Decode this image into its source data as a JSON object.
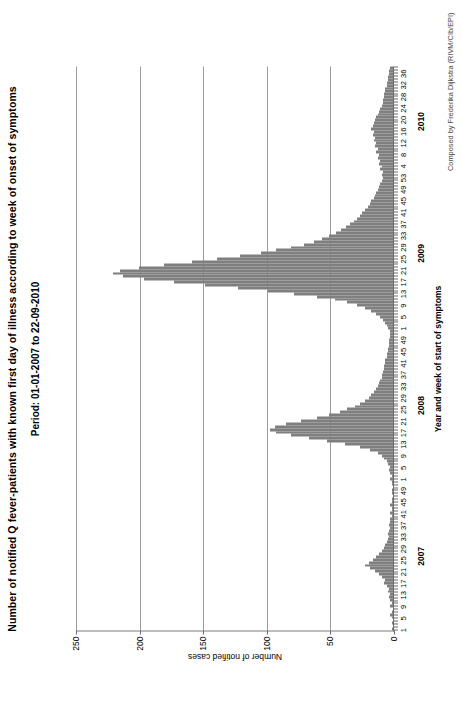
{
  "chart_data": {
    "type": "bar",
    "title": "Number of notified Q fever-patients with known first day of illness according to week of onset of symptoms",
    "subtitle": "Period: 01-01-2007 to 22-09-2010",
    "xlabel": "Year and week of start of symptoms",
    "ylabel": "Number of notified cases",
    "ylim": [
      0,
      250
    ],
    "yticks": [
      0,
      50,
      100,
      150,
      200,
      250
    ],
    "grid": true,
    "legend": null,
    "credit": "Composed by Frederika Dijkstra (RIVM/CIb/EPI)",
    "year_labels": [
      "2007",
      "2008",
      "2009",
      "2010"
    ],
    "week_tick_labels": [
      "1",
      "5",
      "9",
      "13",
      "17",
      "21",
      "25",
      "29",
      "33",
      "37",
      "41",
      "45",
      "49",
      "1",
      "5",
      "9",
      "13",
      "17",
      "21",
      "25",
      "29",
      "33",
      "37",
      "41",
      "45",
      "49",
      "1",
      "5",
      "9",
      "13",
      "17",
      "21",
      "25",
      "29",
      "33",
      "37",
      "41",
      "45",
      "49",
      "53",
      "4",
      "8",
      "12",
      "16",
      "20",
      "24",
      "28",
      "32",
      "36",
      "40",
      "44",
      "48",
      "52"
    ],
    "categories": [
      "2007-w1",
      "2007-w2",
      "2007-w3",
      "2007-w4",
      "2007-w5",
      "2007-w6",
      "2007-w7",
      "2007-w8",
      "2007-w9",
      "2007-w10",
      "2007-w11",
      "2007-w12",
      "2007-w13",
      "2007-w14",
      "2007-w15",
      "2007-w16",
      "2007-w17",
      "2007-w18",
      "2007-w19",
      "2007-w20",
      "2007-w21",
      "2007-w22",
      "2007-w23",
      "2007-w24",
      "2007-w25",
      "2007-w26",
      "2007-w27",
      "2007-w28",
      "2007-w29",
      "2007-w30",
      "2007-w31",
      "2007-w32",
      "2007-w33",
      "2007-w34",
      "2007-w35",
      "2007-w36",
      "2007-w37",
      "2007-w38",
      "2007-w39",
      "2007-w40",
      "2007-w41",
      "2007-w42",
      "2007-w43",
      "2007-w44",
      "2007-w45",
      "2007-w46",
      "2007-w47",
      "2007-w48",
      "2007-w49",
      "2007-w50",
      "2007-w51",
      "2007-w52",
      "2008-w1",
      "2008-w2",
      "2008-w3",
      "2008-w4",
      "2008-w5",
      "2008-w6",
      "2008-w7",
      "2008-w8",
      "2008-w9",
      "2008-w10",
      "2008-w11",
      "2008-w12",
      "2008-w13",
      "2008-w14",
      "2008-w15",
      "2008-w16",
      "2008-w17",
      "2008-w18",
      "2008-w19",
      "2008-w20",
      "2008-w21",
      "2008-w22",
      "2008-w23",
      "2008-w24",
      "2008-w25",
      "2008-w26",
      "2008-w27",
      "2008-w28",
      "2008-w29",
      "2008-w30",
      "2008-w31",
      "2008-w32",
      "2008-w33",
      "2008-w34",
      "2008-w35",
      "2008-w36",
      "2008-w37",
      "2008-w38",
      "2008-w39",
      "2008-w40",
      "2008-w41",
      "2008-w42",
      "2008-w43",
      "2008-w44",
      "2008-w45",
      "2008-w46",
      "2008-w47",
      "2008-w48",
      "2008-w49",
      "2008-w50",
      "2008-w51",
      "2008-w52",
      "2009-w1",
      "2009-w2",
      "2009-w3",
      "2009-w4",
      "2009-w5",
      "2009-w6",
      "2009-w7",
      "2009-w8",
      "2009-w9",
      "2009-w10",
      "2009-w11",
      "2009-w12",
      "2009-w13",
      "2009-w14",
      "2009-w15",
      "2009-w16",
      "2009-w17",
      "2009-w18",
      "2009-w19",
      "2009-w20",
      "2009-w21",
      "2009-w22",
      "2009-w23",
      "2009-w24",
      "2009-w25",
      "2009-w26",
      "2009-w27",
      "2009-w28",
      "2009-w29",
      "2009-w30",
      "2009-w31",
      "2009-w32",
      "2009-w33",
      "2009-w34",
      "2009-w35",
      "2009-w36",
      "2009-w37",
      "2009-w38",
      "2009-w39",
      "2009-w40",
      "2009-w41",
      "2009-w42",
      "2009-w43",
      "2009-w44",
      "2009-w45",
      "2009-w46",
      "2009-w47",
      "2009-w48",
      "2009-w49",
      "2009-w50",
      "2009-w51",
      "2009-w52",
      "2009-w53",
      "2010-w1",
      "2010-w2",
      "2010-w3",
      "2010-w4",
      "2010-w5",
      "2010-w6",
      "2010-w7",
      "2010-w8",
      "2010-w9",
      "2010-w10",
      "2010-w11",
      "2010-w12",
      "2010-w13",
      "2010-w14",
      "2010-w15",
      "2010-w16",
      "2010-w17",
      "2010-w18",
      "2010-w19",
      "2010-w20",
      "2010-w21",
      "2010-w22",
      "2010-w23",
      "2010-w24",
      "2010-w25",
      "2010-w26",
      "2010-w27",
      "2010-w28",
      "2010-w29",
      "2010-w30",
      "2010-w31",
      "2010-w32",
      "2010-w33",
      "2010-w34",
      "2010-w35",
      "2010-w36",
      "2010-w37",
      "2010-w38"
    ],
    "values": [
      1,
      0,
      1,
      0,
      1,
      2,
      1,
      0,
      2,
      1,
      2,
      3,
      2,
      4,
      3,
      5,
      7,
      6,
      9,
      11,
      14,
      18,
      22,
      19,
      16,
      13,
      11,
      9,
      7,
      6,
      5,
      4,
      3,
      4,
      3,
      2,
      3,
      2,
      2,
      1,
      2,
      1,
      1,
      2,
      1,
      1,
      0,
      1,
      1,
      0,
      1,
      1,
      2,
      1,
      2,
      3,
      2,
      4,
      5,
      7,
      9,
      12,
      18,
      26,
      38,
      52,
      66,
      80,
      92,
      97,
      93,
      84,
      72,
      60,
      50,
      42,
      36,
      30,
      26,
      22,
      19,
      17,
      15,
      13,
      12,
      11,
      10,
      9,
      9,
      8,
      7,
      7,
      6,
      6,
      5,
      5,
      4,
      4,
      3,
      3,
      3,
      2,
      2,
      2,
      4,
      5,
      6,
      8,
      10,
      13,
      17,
      22,
      28,
      36,
      46,
      60,
      78,
      98,
      122,
      148,
      172,
      196,
      212,
      220,
      215,
      200,
      180,
      158,
      138,
      120,
      104,
      92,
      80,
      70,
      62,
      56,
      50,
      45,
      41,
      37,
      34,
      31,
      28,
      26,
      24,
      22,
      20,
      18,
      17,
      15,
      14,
      13,
      12,
      11,
      10,
      9,
      8,
      9,
      8,
      10,
      9,
      11,
      10,
      12,
      11,
      13,
      12,
      14,
      13,
      15,
      14,
      16,
      15,
      17,
      16,
      15,
      14,
      13,
      12,
      11,
      10,
      9,
      8,
      8,
      7,
      7,
      6,
      6,
      5,
      5,
      4,
      4,
      3,
      3,
      2
    ]
  }
}
